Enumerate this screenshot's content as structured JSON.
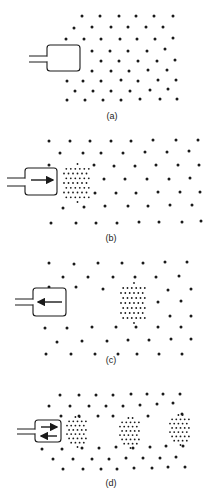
{
  "figure": {
    "colors": {
      "ink": "#1a1a1a",
      "background": "#ffffff"
    },
    "panels": [
      {
        "id": "a",
        "label": "(a)",
        "label_pos": [
          112,
          111
        ],
        "box": {
          "x": 47,
          "y": 45,
          "w": 33,
          "h": 26
        },
        "tube_y": [
          56,
          62
        ],
        "arrows": [],
        "coarse_dots": [
          [
            82,
            16
          ],
          [
            100,
            16
          ],
          [
            119,
            16
          ],
          [
            136,
            16
          ],
          [
            154,
            16
          ],
          [
            173,
            16
          ],
          [
            74,
            28
          ],
          [
            92,
            27
          ],
          [
            111,
            27
          ],
          [
            128,
            27
          ],
          [
            146,
            27
          ],
          [
            163,
            27
          ],
          [
            66,
            39
          ],
          [
            84,
            39
          ],
          [
            101,
            39
          ],
          [
            120,
            39
          ],
          [
            137,
            39
          ],
          [
            155,
            39
          ],
          [
            173,
            38
          ],
          [
            92,
            51
          ],
          [
            110,
            51
          ],
          [
            128,
            51
          ],
          [
            147,
            51
          ],
          [
            165,
            49
          ],
          [
            101,
            61
          ],
          [
            119,
            61
          ],
          [
            138,
            61
          ],
          [
            157,
            61
          ],
          [
            175,
            60
          ],
          [
            92,
            71
          ],
          [
            111,
            71
          ],
          [
            129,
            71
          ],
          [
            148,
            70
          ],
          [
            167,
            70
          ],
          [
            67,
            81
          ],
          [
            83,
            81
          ],
          [
            101,
            81
          ],
          [
            121,
            80
          ],
          [
            138,
            81
          ],
          [
            158,
            80
          ],
          [
            176,
            80
          ],
          [
            75,
            91
          ],
          [
            93,
            91
          ],
          [
            111,
            91
          ],
          [
            130,
            91
          ],
          [
            150,
            90
          ],
          [
            168,
            89
          ],
          [
            67,
            100
          ],
          [
            85,
            100
          ],
          [
            103,
            100
          ],
          [
            121,
            100
          ],
          [
            140,
            99
          ],
          [
            160,
            99
          ],
          [
            177,
            99
          ]
        ],
        "clusters": []
      },
      {
        "id": "b",
        "label": "(b)",
        "label_pos": [
          111,
          233
        ],
        "box": {
          "x": 25,
          "y": 168,
          "w": 32,
          "h": 27
        },
        "tube_y": [
          178,
          186
        ],
        "arrows": [
          {
            "x1": 31,
            "x2": 53,
            "y": 180,
            "dir": "right"
          }
        ],
        "coarse_dots": [
          [
            49,
            141
          ],
          [
            70,
            141
          ],
          [
            90,
            141
          ],
          [
            111,
            141
          ],
          [
            131,
            141
          ],
          [
            153,
            140
          ],
          [
            176,
            140
          ],
          [
            198,
            140
          ],
          [
            60,
            153
          ],
          [
            83,
            153
          ],
          [
            101,
            153
          ],
          [
            123,
            153
          ],
          [
            145,
            152
          ],
          [
            167,
            152
          ],
          [
            189,
            151
          ],
          [
            49,
            165
          ],
          [
            94,
            165
          ],
          [
            114,
            166
          ],
          [
            135,
            166
          ],
          [
            156,
            165
          ],
          [
            178,
            165
          ],
          [
            199,
            165
          ],
          [
            104,
            179
          ],
          [
            125,
            179
          ],
          [
            147,
            179
          ],
          [
            169,
            179
          ],
          [
            190,
            178
          ],
          [
            95,
            193
          ],
          [
            116,
            193
          ],
          [
            136,
            193
          ],
          [
            158,
            192
          ],
          [
            180,
            192
          ],
          [
            200,
            192
          ],
          [
            63,
            208
          ],
          [
            84,
            207
          ],
          [
            105,
            206
          ],
          [
            128,
            206
          ],
          [
            148,
            206
          ],
          [
            170,
            205
          ],
          [
            192,
            205
          ],
          [
            51,
            223
          ],
          [
            76,
            223
          ],
          [
            96,
            223
          ],
          [
            117,
            223
          ],
          [
            139,
            222
          ],
          [
            159,
            222
          ],
          [
            182,
            222
          ],
          [
            201,
            221
          ]
        ],
        "clusters": [
          {
            "x": 64,
            "y": 164,
            "w": 27,
            "h": 38,
            "cols": 6,
            "rows": 9
          }
        ]
      },
      {
        "id": "c",
        "label": "(c)",
        "label_pos": [
          111,
          355
        ],
        "box": {
          "x": 33,
          "y": 288,
          "w": 33,
          "h": 28
        },
        "tube_y": [
          299,
          305
        ],
        "arrows": [
          {
            "x1": 62,
            "x2": 38,
            "y": 302,
            "dir": "left"
          }
        ],
        "coarse_dots": [
          [
            49,
            263
          ],
          [
            74,
            264
          ],
          [
            98,
            263
          ],
          [
            122,
            263
          ],
          [
            143,
            263
          ],
          [
            165,
            262
          ],
          [
            187,
            262
          ],
          [
            63,
            277
          ],
          [
            88,
            277
          ],
          [
            113,
            277
          ],
          [
            135,
            277
          ],
          [
            156,
            277
          ],
          [
            179,
            276
          ],
          [
            49,
            287
          ],
          [
            76,
            287
          ],
          [
            103,
            289
          ],
          [
            168,
            290
          ],
          [
            191,
            289
          ],
          [
            158,
            302
          ],
          [
            181,
            301
          ],
          [
            170,
            316
          ],
          [
            191,
            316
          ],
          [
            45,
            328
          ],
          [
            67,
            328
          ],
          [
            92,
            327
          ],
          [
            116,
            327
          ],
          [
            136,
            327
          ],
          [
            158,
            327
          ],
          [
            181,
            327
          ],
          [
            57,
            342
          ],
          [
            82,
            341
          ],
          [
            107,
            341
          ],
          [
            128,
            340
          ],
          [
            149,
            340
          ],
          [
            171,
            339
          ],
          [
            191,
            339
          ],
          [
            46,
            354
          ],
          [
            71,
            354
          ],
          [
            95,
            354
          ],
          [
            118,
            354
          ],
          [
            137,
            354
          ],
          [
            159,
            354
          ],
          [
            182,
            354
          ]
        ],
        "clusters": [
          {
            "x": 121,
            "y": 283,
            "w": 26,
            "h": 40,
            "cols": 6,
            "rows": 9
          }
        ]
      },
      {
        "id": "d",
        "label": "(d)",
        "label_pos": [
          111,
          478
        ],
        "box": {
          "x": 35,
          "y": 420,
          "w": 26,
          "h": 22
        },
        "tube_y": [
          429,
          434
        ],
        "arrows": [
          {
            "x1": 41,
            "x2": 57,
            "y": 427,
            "dir": "right"
          },
          {
            "x1": 57,
            "x2": 41,
            "y": 436,
            "dir": "left"
          }
        ],
        "coarse_dots": [
          [
            60,
            395
          ],
          [
            79,
            395
          ],
          [
            96,
            395
          ],
          [
            113,
            395
          ],
          [
            131,
            394
          ],
          [
            147,
            394
          ],
          [
            163,
            394
          ],
          [
            180,
            394
          ],
          [
            49,
            406
          ],
          [
            70,
            406
          ],
          [
            89,
            406
          ],
          [
            106,
            406
          ],
          [
            123,
            406
          ],
          [
            140,
            405
          ],
          [
            157,
            404
          ],
          [
            173,
            403
          ],
          [
            61,
            416
          ],
          [
            79,
            416
          ],
          [
            98,
            416
          ],
          [
            113,
            416
          ],
          [
            148,
            416
          ],
          [
            182,
            414
          ],
          [
            42,
            449
          ],
          [
            62,
            449
          ],
          [
            82,
            448
          ],
          [
            99,
            448
          ],
          [
            116,
            447
          ],
          [
            133,
            448
          ],
          [
            150,
            447
          ],
          [
            166,
            446
          ],
          [
            183,
            446
          ],
          [
            53,
            459
          ],
          [
            73,
            459
          ],
          [
            92,
            459
          ],
          [
            109,
            459
          ],
          [
            126,
            458
          ],
          [
            143,
            458
          ],
          [
            160,
            458
          ],
          [
            176,
            457
          ],
          [
            63,
            469
          ],
          [
            83,
            469
          ],
          [
            101,
            469
          ],
          [
            117,
            469
          ],
          [
            134,
            468
          ],
          [
            152,
            468
          ],
          [
            168,
            467
          ],
          [
            185,
            467
          ]
        ],
        "clusters": [
          {
            "x": 67,
            "y": 417,
            "w": 21,
            "h": 30,
            "cols": 5,
            "rows": 8
          },
          {
            "x": 120,
            "y": 418,
            "w": 21,
            "h": 30,
            "cols": 5,
            "rows": 8
          },
          {
            "x": 170,
            "y": 415,
            "w": 21,
            "h": 30,
            "cols": 5,
            "rows": 8
          }
        ]
      }
    ]
  }
}
